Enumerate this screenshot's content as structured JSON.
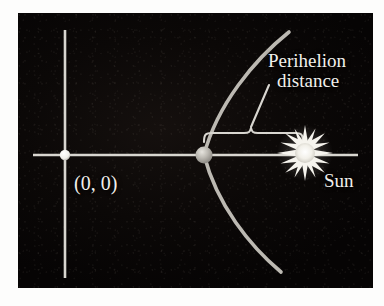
{
  "figure": {
    "kind": "orbit-diagram",
    "panel": {
      "background_color": "#0a0706",
      "border_color": "#ffffff",
      "width": 355,
      "height": 275
    },
    "axes": {
      "color": "#d8d6d0",
      "x_axis": {
        "y": 142,
        "x_start": 15,
        "x_end": 340
      },
      "y_axis": {
        "x": 47,
        "y_start": 17,
        "y_end": 265
      }
    },
    "labels": {
      "perihelion_line1": "Perihelion",
      "perihelion_line2": "distance",
      "origin": "(0, 0)",
      "sun": "Sun"
    },
    "markers": {
      "origin_point": {
        "name": "origin-dot",
        "x": 47,
        "y": 142,
        "radius": 5,
        "color": "#ffffff"
      },
      "perihelion_point": {
        "name": "comet-dot",
        "x": 186,
        "y": 142,
        "radius": 8,
        "color": "#b8b6b0"
      },
      "sun": {
        "name": "sun-starburst",
        "x": 287,
        "y": 140,
        "radius": 21,
        "core_radius": 9,
        "points": 16,
        "color": "#f6f4ee"
      }
    },
    "orbit": {
      "name": "parabolic-orbit-path",
      "color": "#bcb9b2",
      "stroke_width": 3.6,
      "vertex_x": 186,
      "vertex_y": 142,
      "top_end": {
        "x": 271,
        "y": 19
      },
      "bottom_end": {
        "x": 263,
        "y": 259
      }
    },
    "brace": {
      "name": "perihelion-distance-brace",
      "color": "#d8d6d0",
      "stroke_width": 2.1,
      "left_x": 186,
      "right_x": 285,
      "y": 120,
      "peak_x": 233,
      "drop": 9
    },
    "leader_line": {
      "name": "perihelion-leader-line",
      "color": "#d8d6d0",
      "from": {
        "x": 233,
        "y": 116
      },
      "to": {
        "x": 251,
        "y": 74
      }
    },
    "colors": {
      "panel_bg": "#0a0706",
      "axis": "#d8d6d0",
      "orbit": "#bcb9b2",
      "text": "#f2f0ec",
      "sun": "#f6f4ee",
      "comet": "#b8b6b0",
      "paper": "#fdfdfc"
    }
  }
}
